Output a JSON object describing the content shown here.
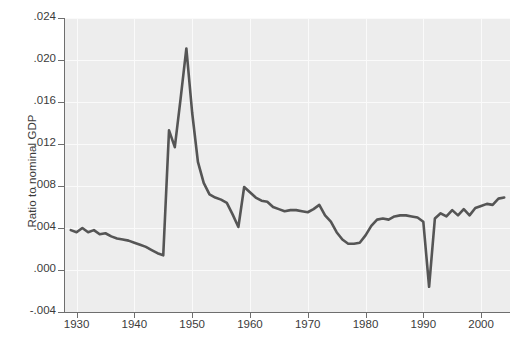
{
  "chart_data": {
    "type": "line",
    "title": "",
    "xlabel": "",
    "ylabel": "Ratio to nominal GDP",
    "xlim": [
      1928,
      2005
    ],
    "ylim": [
      -0.004,
      0.024
    ],
    "xticks": [
      1930,
      1940,
      1950,
      1960,
      1970,
      1980,
      1990,
      2000
    ],
    "xticklabels": [
      "1930",
      "1940",
      "1950",
      "1960",
      "1970",
      "1980",
      "1990",
      "2000"
    ],
    "yticks": [
      -0.004,
      0.0,
      0.004,
      0.008,
      0.012,
      0.016,
      0.02,
      0.024
    ],
    "yticklabels": [
      "-.004",
      ".000",
      ".004",
      ".008",
      ".012",
      ".016",
      ".020",
      ".024"
    ],
    "grid": true,
    "legend": "none",
    "line_color": "#555555",
    "panel_color": "#ededed",
    "grid_color": "#fafafa",
    "axis_color": "#6e6e6e",
    "x": [
      1929,
      1930,
      1931,
      1932,
      1933,
      1934,
      1935,
      1936,
      1937,
      1938,
      1939,
      1940,
      1941,
      1942,
      1943,
      1944,
      1945,
      1946,
      1947,
      1948,
      1949,
      1950,
      1951,
      1952,
      1953,
      1954,
      1955,
      1956,
      1957,
      1958,
      1959,
      1960,
      1961,
      1962,
      1963,
      1964,
      1965,
      1966,
      1967,
      1968,
      1969,
      1970,
      1971,
      1972,
      1973,
      1974,
      1975,
      1976,
      1977,
      1978,
      1979,
      1980,
      1981,
      1982,
      1983,
      1984,
      1985,
      1986,
      1987,
      1988,
      1989,
      1990,
      1991,
      1992,
      1993,
      1994,
      1995,
      1996,
      1997,
      1998,
      1999,
      2000,
      2001,
      2002,
      2003,
      2004
    ],
    "y": [
      0.0038,
      0.0036,
      0.004,
      0.0036,
      0.0038,
      0.0034,
      0.0035,
      0.0032,
      0.003,
      0.0029,
      0.0028,
      0.0026,
      0.0024,
      0.0022,
      0.0019,
      0.0016,
      0.0014,
      0.0133,
      0.0117,
      0.0163,
      0.0211,
      0.015,
      0.0103,
      0.0083,
      0.0072,
      0.0069,
      0.0067,
      0.0064,
      0.0053,
      0.0041,
      0.0079,
      0.0074,
      0.0069,
      0.0066,
      0.0065,
      0.006,
      0.0058,
      0.0056,
      0.0057,
      0.0057,
      0.0056,
      0.0055,
      0.0058,
      0.0062,
      0.0052,
      0.0046,
      0.0036,
      0.0029,
      0.0025,
      0.0025,
      0.0026,
      0.0033,
      0.0042,
      0.0048,
      0.0049,
      0.0048,
      0.0051,
      0.0052,
      0.0052,
      0.0051,
      0.005,
      0.0046,
      -0.0016,
      0.0049,
      0.0054,
      0.0051,
      0.0057,
      0.0052,
      0.0058,
      0.0052,
      0.0059,
      0.0061,
      0.0063,
      0.0062,
      0.0068,
      0.0069
    ]
  }
}
